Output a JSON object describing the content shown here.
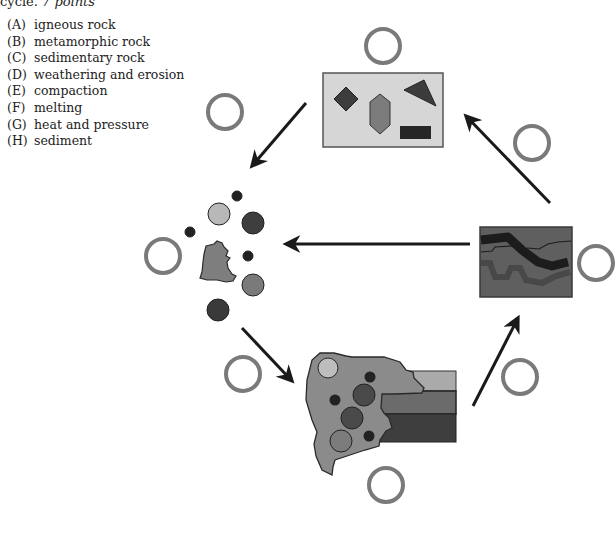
{
  "header": {
    "prefix": "cycle.",
    "points": "7 points"
  },
  "legend": {
    "items": [
      {
        "letter": "(A)",
        "label": "igneous rock"
      },
      {
        "letter": "(B)",
        "label": "metamorphic rock"
      },
      {
        "letter": "(C)",
        "label": "sedimentary rock"
      },
      {
        "letter": "(D)",
        "label": "weathering and erosion"
      },
      {
        "letter": "(E)",
        "label": "compaction"
      },
      {
        "letter": "(F)",
        "label": "melting"
      },
      {
        "letter": "(G)",
        "label": "heat and pressure"
      },
      {
        "letter": "(H)",
        "label": "sediment"
      }
    ]
  },
  "diagram": {
    "answer_circles": [
      {
        "id": "top",
        "cx": 383,
        "cy": 46
      },
      {
        "id": "upper-left",
        "cx": 225,
        "cy": 112
      },
      {
        "id": "upper-right",
        "cx": 532,
        "cy": 143
      },
      {
        "id": "left",
        "cx": 163,
        "cy": 256
      },
      {
        "id": "right",
        "cx": 596,
        "cy": 263
      },
      {
        "id": "lower-left",
        "cx": 243,
        "cy": 374
      },
      {
        "id": "lower-right",
        "cx": 520,
        "cy": 377
      },
      {
        "id": "bottom",
        "cx": 386,
        "cy": 485
      }
    ],
    "colors": {
      "circle_ring": "#777777",
      "arrow": "#1a1a1a",
      "panel_light": "#d4d4d4",
      "shape_dark": "#3a3a3a",
      "shape_mid": "#7a7a7a",
      "shape_light": "#b5b5b5",
      "metamorphic_bg": "#5e5e5e"
    }
  }
}
